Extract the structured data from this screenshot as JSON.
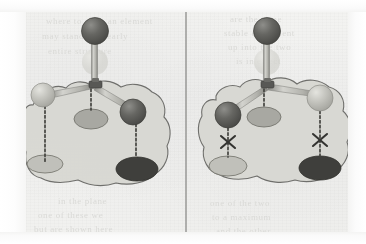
{
  "figure": {
    "panel_count": 2,
    "divider": {
      "orientation": "vertical",
      "x": 186,
      "y_top": 12,
      "y_bottom": 234,
      "color": "#8d8d8a"
    }
  },
  "palette": {
    "paper": "#f1f1ef",
    "paper_edge": "#ffffff",
    "blob_fill": "#d7d7d2",
    "blob_stroke": "#6f6f6c",
    "sphere_dark": "#5b5b58",
    "sphere_dark_hi": "#8e8e8a",
    "sphere_light": "#bdbdb7",
    "sphere_light_hi": "#e4e4df",
    "sphere_ghost": "#d5d5d0",
    "rod": "#b6b6b0",
    "rod_edge": "#7c7c78",
    "shadow_dark": "#4a4a47",
    "shadow_mid": "#a8a8a2",
    "shadow_light": "#c4c4be",
    "dotted": "#4a4a47",
    "x_mark": "#3c3c39",
    "ghost_text": "#d9d9d6"
  },
  "left_panel": {
    "name": "allowed-configuration",
    "apex_sphere": {
      "label": "top-dark-sphere",
      "shade": "dark",
      "cx": 95,
      "cy": 31,
      "r": 13
    },
    "ghost_sphere": {
      "label": "translucent-ghost-sphere",
      "shade": "ghost",
      "cx": 95,
      "cy": 62,
      "r": 13
    },
    "hub": {
      "label": "tetrahedral-hub",
      "x": 95,
      "y": 86
    },
    "arm_spheres": [
      {
        "label": "left-light-sphere",
        "shade": "light",
        "cx": 43,
        "cy": 95,
        "r": 12
      },
      {
        "label": "right-dark-sphere",
        "shade": "dark",
        "cx": 133,
        "cy": 112,
        "r": 13
      }
    ],
    "shadows": [
      {
        "label": "left-shadow-ellipse",
        "tone": "light",
        "cx": 45,
        "cy": 164,
        "rx": 18,
        "ry": 9
      },
      {
        "label": "center-shadow-ellipse",
        "tone": "mid",
        "cx": 91,
        "cy": 119,
        "rx": 17,
        "ry": 10
      },
      {
        "label": "right-shadow-ellipse",
        "tone": "dark",
        "cx": 137,
        "cy": 169,
        "rx": 21,
        "ry": 12
      }
    ],
    "projection_lines": [
      {
        "label": "left-projection",
        "x": 45,
        "y1": 107,
        "y2": 164,
        "crossed": false
      },
      {
        "label": "center-projection",
        "x": 91,
        "y1": 88,
        "y2": 110,
        "crossed": false
      },
      {
        "label": "right-projection",
        "x": 136,
        "y1": 125,
        "y2": 158,
        "crossed": false
      }
    ],
    "x_marks": []
  },
  "right_panel": {
    "name": "forbidden-configuration",
    "apex_sphere": {
      "label": "top-dark-sphere",
      "shade": "dark",
      "cx": 267,
      "cy": 31,
      "r": 13
    },
    "ghost_sphere": {
      "label": "translucent-ghost-sphere",
      "shade": "ghost",
      "cx": 267,
      "cy": 62,
      "r": 13
    },
    "hub": {
      "label": "tetrahedral-hub",
      "x": 267,
      "y": 86
    },
    "arm_spheres": [
      {
        "label": "left-dark-sphere",
        "shade": "dark",
        "cx": 228,
        "cy": 115,
        "r": 13
      },
      {
        "label": "right-light-sphere",
        "shade": "light",
        "cx": 320,
        "cy": 98,
        "r": 13
      }
    ],
    "shadows": [
      {
        "label": "left-shadow-ellipse",
        "tone": "light",
        "cx": 228,
        "cy": 166,
        "rx": 19,
        "ry": 10
      },
      {
        "label": "center-shadow-ellipse",
        "tone": "mid",
        "cx": 264,
        "cy": 117,
        "rx": 17,
        "ry": 10
      },
      {
        "label": "right-shadow-ellipse",
        "tone": "dark",
        "cx": 320,
        "cy": 168,
        "rx": 21,
        "ry": 12
      }
    ],
    "projection_lines": [
      {
        "label": "left-projection",
        "x": 228,
        "y1": 128,
        "y2": 156,
        "crossed": true
      },
      {
        "label": "center-projection",
        "x": 264,
        "y1": 88,
        "y2": 108,
        "crossed": false
      },
      {
        "label": "right-projection",
        "x": 320,
        "y1": 111,
        "y2": 157,
        "crossed": true
      }
    ],
    "x_marks": [
      {
        "label": "left-x-mark",
        "cx": 228,
        "cy": 142,
        "size": 7
      },
      {
        "label": "right-x-mark",
        "cx": 320,
        "cy": 140,
        "size": 7
      }
    ]
  },
  "ghost_text": {
    "note": "faint bleed-through text from reverse of page",
    "lines": [
      {
        "text": "where to view   an element",
        "x": 46,
        "y": 16
      },
      {
        "text": "may  stand   for  nearly",
        "x": 42,
        "y": 31
      },
      {
        "text": "entire   structure",
        "x": 48,
        "y": 46
      },
      {
        "text": "are  the  same",
        "x": 230,
        "y": 14
      },
      {
        "text": "stable  equivalent",
        "x": 224,
        "y": 28
      },
      {
        "text": "up  into   the  two",
        "x": 228,
        "y": 42
      },
      {
        "text": "is   in   effect",
        "x": 236,
        "y": 56
      },
      {
        "text": "in  the  plane",
        "x": 58,
        "y": 196
      },
      {
        "text": "one   of   these   we",
        "x": 38,
        "y": 210
      },
      {
        "text": "but  are   shown   here",
        "x": 34,
        "y": 224
      },
      {
        "text": "one  of   the   two",
        "x": 210,
        "y": 198
      },
      {
        "text": "to  a  maximum",
        "x": 212,
        "y": 212
      },
      {
        "text": "and   the   other",
        "x": 216,
        "y": 226
      }
    ]
  }
}
